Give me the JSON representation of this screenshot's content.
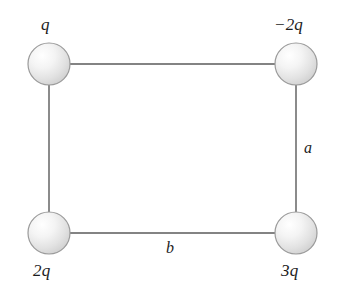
{
  "figure": {
    "name": "charge-rectangle-diagram",
    "background_color": "#ffffff",
    "line_color": "#555555",
    "sphere_fill_light": "#fbfbfb",
    "sphere_fill_dark": "#d3d3d3",
    "sphere_stroke": "#8a8a8a",
    "text_color": "#1c1c1c"
  },
  "charges": [
    {
      "id": "top-left",
      "label": "q",
      "cx": 49,
      "cy": 64,
      "r": 21
    },
    {
      "id": "top-right",
      "label": "−2q",
      "cx": 296,
      "cy": 64,
      "r": 21
    },
    {
      "id": "bottom-left",
      "label": "2q",
      "cx": 49,
      "cy": 233,
      "r": 21
    },
    {
      "id": "bottom-right",
      "label": "3q",
      "cx": 296,
      "cy": 233,
      "r": 21
    }
  ],
  "sides": {
    "vertical_right_label": "a",
    "horizontal_bottom_label": "b"
  },
  "edges": [
    {
      "id": "top-edge",
      "x1": 70,
      "y1": 64,
      "x2": 275,
      "y2": 64
    },
    {
      "id": "right-edge",
      "x1": 296,
      "y1": 85,
      "x2": 296,
      "y2": 212
    },
    {
      "id": "bottom-edge",
      "x1": 70,
      "y1": 233,
      "x2": 275,
      "y2": 233
    },
    {
      "id": "left-edge",
      "x1": 49,
      "y1": 85,
      "x2": 49,
      "y2": 212
    }
  ]
}
